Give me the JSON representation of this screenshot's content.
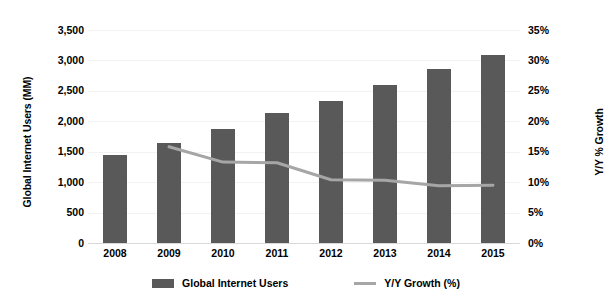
{
  "chart_data": {
    "type": "bar",
    "title": "",
    "subtitle": "",
    "xlabel": "",
    "ylabel": "Global Internet Users (MM)",
    "y2label": "Y/Y % Growth",
    "categories": [
      "2008",
      "2009",
      "2010",
      "2011",
      "2012",
      "2013",
      "2014",
      "2015"
    ],
    "ylim": [
      0,
      3500
    ],
    "y2lim": [
      0,
      35
    ],
    "yticks": [
      "0",
      "500",
      "1,000",
      "1,500",
      "2,000",
      "2,500",
      "3,000",
      "3,500"
    ],
    "ytick_values": [
      0,
      500,
      1000,
      1500,
      2000,
      2500,
      3000,
      3500
    ],
    "y2ticks": [
      "0%",
      "5%",
      "10%",
      "15%",
      "20%",
      "25%",
      "30%",
      "35%"
    ],
    "y2tick_values": [
      0,
      5,
      10,
      15,
      20,
      25,
      30,
      35
    ],
    "grid": true,
    "legend_position": "bottom",
    "series": [
      {
        "name": "Global Internet Users",
        "type": "bar",
        "axis": "left",
        "unit": "MM",
        "color": "#595959",
        "values": [
          1440,
          1650,
          1870,
          2140,
          2340,
          2600,
          2860,
          3090
        ]
      },
      {
        "name": "Y/Y Growth (%)",
        "type": "line",
        "axis": "right",
        "unit": "%",
        "color": "#a6a6a6",
        "values": [
          null,
          15.8,
          13.3,
          13.2,
          10.4,
          10.3,
          9.4,
          9.5
        ]
      }
    ]
  },
  "legend": {
    "items": [
      {
        "label": "Global Internet Users",
        "marker": "bar-swatch",
        "color": "#595959"
      },
      {
        "label": "Y/Y Growth (%)",
        "marker": "line-swatch",
        "color": "#a6a6a6"
      }
    ]
  },
  "colors": {
    "bar": "#595959",
    "line": "#a6a6a6",
    "gridline": "#f2f2f2",
    "baseline": "#d9d9d9",
    "text": "#000000",
    "background": "#ffffff"
  }
}
